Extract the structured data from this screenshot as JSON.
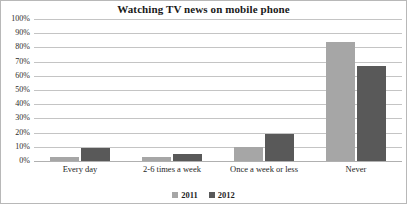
{
  "chart_data": {
    "type": "bar",
    "title": "Watching TV news on mobile phone",
    "xlabel": "",
    "ylabel": "",
    "ylim": [
      0,
      100
    ],
    "yticks": [
      "0%",
      "10%",
      "20%",
      "30%",
      "40%",
      "50%",
      "60%",
      "70%",
      "80%",
      "90%",
      "100%"
    ],
    "ytick_values": [
      0,
      10,
      20,
      30,
      40,
      50,
      60,
      70,
      80,
      90,
      100
    ],
    "grid": "horizontal",
    "legend_position": "bottom-center",
    "categories": [
      "Every day",
      "2-6 times a week",
      "Once a week or less",
      "Never"
    ],
    "series": [
      {
        "name": "2011",
        "color": "#a6a6a6",
        "values": [
          3,
          3,
          10,
          84
        ]
      },
      {
        "name": "2012",
        "color": "#595959",
        "values": [
          9,
          5,
          19,
          67
        ]
      }
    ]
  },
  "colors": {
    "series_2011": "#a6a6a6",
    "series_2012": "#595959",
    "gridline": "#c4c4c4",
    "border": "#b8b8b8",
    "text": "#1f1f1f"
  }
}
